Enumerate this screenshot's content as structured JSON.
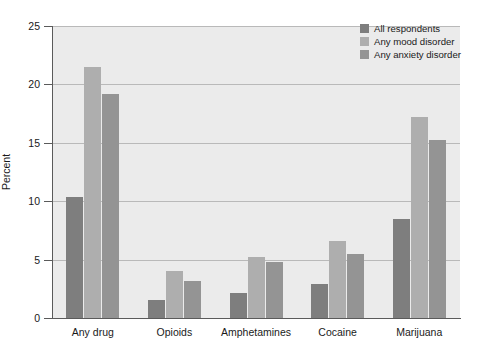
{
  "chart_data": {
    "type": "bar",
    "title": "",
    "xlabel": "",
    "ylabel": "Percent",
    "ylim": [
      0,
      25
    ],
    "yticks": [
      0,
      5,
      10,
      15,
      20,
      25
    ],
    "ytick_labels": [
      "0",
      "5",
      "10",
      "15",
      "20",
      "25"
    ],
    "grid": "horizontal",
    "legend_position": "top-right",
    "categories": [
      "Any drug",
      "Opioids",
      "Amphetamines",
      "Cocaine",
      "Marijuana"
    ],
    "series": [
      {
        "name": "All respondents",
        "color": "#7e7e7e",
        "values": [
          10.4,
          1.5,
          2.1,
          2.9,
          8.5
        ]
      },
      {
        "name": "Any mood disorder",
        "color": "#aeaeae",
        "values": [
          21.5,
          4.0,
          5.2,
          6.6,
          17.2
        ]
      },
      {
        "name": "Any anxiety disorder",
        "color": "#949494",
        "values": [
          19.2,
          3.2,
          4.8,
          5.5,
          15.2
        ]
      }
    ]
  },
  "style": {
    "plot_background": "#ebebeb",
    "gridline_color": "#b9b9b9",
    "axis_color": "#5a5a5a",
    "page_background": "#ffffff",
    "text_color": "#1a1a1a"
  }
}
